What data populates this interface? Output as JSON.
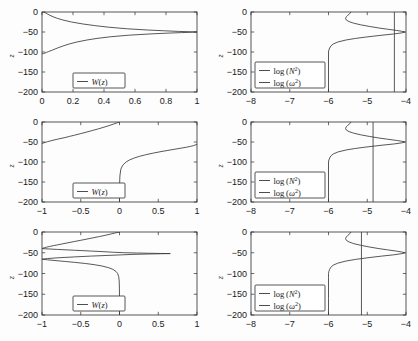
{
  "figure": {
    "rows": 3,
    "cols": 2,
    "background": "#fdfdfd",
    "curve_color": "#3a3a3a",
    "axis_color": "#2b2b2b"
  },
  "chart_data": [
    {
      "id": "panel-r1c1",
      "type": "line",
      "title": "",
      "xlabel": "",
      "ylabel": "z",
      "xlim": [
        0,
        1
      ],
      "ylim": [
        -200,
        0
      ],
      "xticks": [
        0,
        0.2,
        0.4,
        0.6,
        0.8,
        1
      ],
      "xticklabels": [
        "0",
        "0.2",
        "0.4",
        "0.6",
        "0.8",
        "1"
      ],
      "yticks": [
        0,
        -50,
        -100,
        -150,
        -200
      ],
      "yticklabels": [
        "0",
        "-50",
        "-100",
        "-150",
        "-200"
      ],
      "grid": false,
      "legend_position": "lower-center-left",
      "legend": [
        "W(z)"
      ],
      "series": [
        {
          "name": "W(z)",
          "orientation": "x-of-y",
          "y": [
            0,
            -2,
            -5,
            -8,
            -12,
            -16,
            -20,
            -25,
            -30,
            -34,
            -38,
            -42,
            -45,
            -47,
            -48.5,
            -49.5,
            -50,
            -50.5,
            -51.5,
            -53,
            -55,
            -58,
            -62,
            -66,
            -70,
            -75,
            -80,
            -85,
            -90,
            -95,
            -99,
            -101,
            -103,
            -104,
            -105
          ],
          "x": [
            0.012,
            0.022,
            0.035,
            0.05,
            0.072,
            0.1,
            0.135,
            0.19,
            0.265,
            0.34,
            0.43,
            0.55,
            0.68,
            0.79,
            0.88,
            0.96,
            1.0,
            0.97,
            0.9,
            0.8,
            0.69,
            0.56,
            0.44,
            0.355,
            0.29,
            0.225,
            0.175,
            0.135,
            0.1,
            0.068,
            0.042,
            0.029,
            0.018,
            0.009,
            0.0
          ]
        }
      ]
    },
    {
      "id": "panel-r1c2",
      "type": "line",
      "title": "",
      "xlabel": "",
      "ylabel": "z",
      "xlim": [
        -8,
        -4
      ],
      "ylim": [
        -200,
        0
      ],
      "xticks": [
        -8,
        -7,
        -6,
        -5,
        -4
      ],
      "xticklabels": [
        "-8",
        "-7",
        "-6",
        "-5",
        "-4"
      ],
      "yticks": [
        0,
        -50,
        -100,
        -150,
        -200
      ],
      "yticklabels": [
        "0",
        "-50",
        "-100",
        "-150",
        "-200"
      ],
      "grid": false,
      "legend_position": "lower-left",
      "legend": [
        "log (N^2)",
        "log (ω^2)"
      ],
      "series": [
        {
          "name": "log (N^2)",
          "orientation": "x-of-y",
          "y": [
            0,
            -4,
            -8,
            -12,
            -16,
            -20,
            -24,
            -28,
            -32,
            -36,
            -40,
            -43,
            -46,
            -48,
            -50,
            -52,
            -55,
            -58,
            -62,
            -66,
            -70,
            -75,
            -80,
            -85,
            -90,
            -95,
            -100,
            -110,
            -130,
            -160,
            -200
          ],
          "x": [
            -5.42,
            -5.45,
            -5.5,
            -5.54,
            -5.56,
            -5.54,
            -5.47,
            -5.35,
            -5.17,
            -4.95,
            -4.7,
            -4.48,
            -4.25,
            -4.12,
            -4.03,
            -4.1,
            -4.32,
            -4.62,
            -4.98,
            -5.3,
            -5.55,
            -5.76,
            -5.88,
            -5.94,
            -5.97,
            -5.99,
            -6.0,
            -6.0,
            -6.0,
            -6.0,
            -6.0
          ]
        },
        {
          "name": "log (ω^2)",
          "orientation": "vertical-line",
          "value": -4.3
        }
      ]
    },
    {
      "id": "panel-r2c1",
      "type": "line",
      "title": "",
      "xlabel": "",
      "ylabel": "z",
      "xlim": [
        -1,
        1
      ],
      "ylim": [
        -200,
        0
      ],
      "xticks": [
        -1,
        -0.5,
        0,
        0.5,
        1
      ],
      "xticklabels": [
        "-1",
        "-0.5",
        "0",
        "0.5",
        "1"
      ],
      "yticks": [
        0,
        -50,
        -100,
        -150,
        -200
      ],
      "yticklabels": [
        "0",
        "-50",
        "-100",
        "-150",
        "-200"
      ],
      "grid": false,
      "legend_position": "lower-center-left",
      "legend": [
        "W(z)"
      ],
      "series": [
        {
          "name": "W(z) upper branch",
          "orientation": "x-of-y",
          "y": [
            0,
            -2,
            -5,
            -9,
            -13,
            -17,
            -21,
            -25,
            -29,
            -33,
            -36,
            -39,
            -41,
            -43,
            -45,
            -47,
            -49,
            -51,
            -53,
            -54.5
          ],
          "x": [
            0.0,
            -0.03,
            -0.075,
            -0.135,
            -0.2,
            -0.27,
            -0.345,
            -0.42,
            -0.5,
            -0.58,
            -0.645,
            -0.705,
            -0.755,
            -0.8,
            -0.845,
            -0.885,
            -0.925,
            -0.96,
            -0.99,
            -1.0
          ]
        },
        {
          "name": "W(z) lower branch",
          "orientation": "x-of-y",
          "y": [
            -55.5,
            -57,
            -59,
            -61,
            -63,
            -65,
            -68,
            -71,
            -74,
            -78,
            -82,
            -86,
            -90,
            -95,
            -100,
            -108,
            -118,
            -135,
            -160,
            -200
          ],
          "x": [
            1.0,
            0.985,
            0.955,
            0.915,
            0.865,
            0.805,
            0.715,
            0.625,
            0.535,
            0.43,
            0.335,
            0.255,
            0.19,
            0.128,
            0.085,
            0.042,
            0.017,
            0.005,
            0.001,
            0.0
          ]
        }
      ]
    },
    {
      "id": "panel-r2c2",
      "type": "line",
      "title": "",
      "xlabel": "",
      "ylabel": "z",
      "xlim": [
        -8,
        -4
      ],
      "ylim": [
        -200,
        0
      ],
      "xticks": [
        -8,
        -7,
        -6,
        -5,
        -4
      ],
      "xticklabels": [
        "-8",
        "-7",
        "-6",
        "-5",
        "-4"
      ],
      "yticks": [
        0,
        -50,
        -100,
        -150,
        -200
      ],
      "yticklabels": [
        "0",
        "-50",
        "-100",
        "-150",
        "-200"
      ],
      "grid": false,
      "legend_position": "lower-left",
      "legend": [
        "log (N^2)",
        "log (ω^2)"
      ],
      "series": [
        {
          "name": "log (N^2)",
          "orientation": "x-of-y",
          "y": [
            0,
            -4,
            -8,
            -12,
            -16,
            -20,
            -24,
            -28,
            -32,
            -36,
            -40,
            -43,
            -46,
            -48,
            -50,
            -52,
            -55,
            -58,
            -62,
            -66,
            -70,
            -75,
            -80,
            -85,
            -90,
            -95,
            -100,
            -110,
            -130,
            -160,
            -200
          ],
          "x": [
            -5.42,
            -5.45,
            -5.5,
            -5.54,
            -5.56,
            -5.54,
            -5.47,
            -5.35,
            -5.17,
            -4.95,
            -4.7,
            -4.48,
            -4.25,
            -4.12,
            -4.03,
            -4.1,
            -4.32,
            -4.62,
            -4.98,
            -5.3,
            -5.55,
            -5.76,
            -5.88,
            -5.94,
            -5.97,
            -5.99,
            -6.0,
            -6.0,
            -6.0,
            -6.0,
            -6.0
          ]
        },
        {
          "name": "log (ω^2)",
          "orientation": "vertical-line",
          "value": -4.85
        }
      ]
    },
    {
      "id": "panel-r3c1",
      "type": "line",
      "title": "",
      "xlabel": "",
      "ylabel": "z",
      "xlim": [
        -1,
        1
      ],
      "ylim": [
        -200,
        0
      ],
      "xticks": [
        -1,
        -0.5,
        0,
        0.5,
        1
      ],
      "xticklabels": [
        "-1",
        "-0.5",
        "0",
        "0.5",
        "1"
      ],
      "yticks": [
        0,
        -50,
        -100,
        -150,
        -200
      ],
      "yticklabels": [
        "0",
        "-50",
        "-100",
        "-150",
        "-200"
      ],
      "grid": false,
      "legend_position": "lower-center-left",
      "legend": [
        "W(z)"
      ],
      "series": [
        {
          "name": "W(z) upper branch",
          "orientation": "x-of-y",
          "y": [
            0,
            -2,
            -5,
            -8,
            -11,
            -14,
            -17,
            -20,
            -23,
            -26,
            -29,
            -31,
            -33,
            -35,
            -36.5,
            -38,
            -39,
            -40
          ],
          "x": [
            0.0,
            -0.05,
            -0.115,
            -0.185,
            -0.26,
            -0.34,
            -0.42,
            -0.5,
            -0.585,
            -0.665,
            -0.745,
            -0.8,
            -0.855,
            -0.905,
            -0.94,
            -0.97,
            -0.99,
            -1.0
          ]
        },
        {
          "name": "W(z) resonance upper",
          "orientation": "x-of-y",
          "y": [
            -40,
            -42,
            -44,
            -46,
            -47.5,
            -48.8,
            -49.8,
            -50.6,
            -51.2,
            -51.7,
            -52
          ],
          "x": [
            -1.0,
            -0.8,
            -0.58,
            -0.36,
            -0.2,
            -0.08,
            0.05,
            0.22,
            0.38,
            0.53,
            0.65
          ]
        },
        {
          "name": "W(z) resonance lower",
          "orientation": "x-of-y",
          "y": [
            -52,
            -52.4,
            -53,
            -53.8,
            -55,
            -56.5,
            -58,
            -60,
            -62,
            -64,
            -65.5
          ],
          "x": [
            0.65,
            0.53,
            0.37,
            0.2,
            0.03,
            -0.16,
            -0.36,
            -0.58,
            -0.78,
            -0.93,
            -1.0
          ]
        },
        {
          "name": "W(z) lower branch",
          "orientation": "x-of-y",
          "y": [
            -65.5,
            -67,
            -69,
            -71,
            -73,
            -76,
            -79,
            -82,
            -86,
            -90,
            -95,
            -100,
            -108,
            -118,
            -135,
            -160,
            -200
          ],
          "x": [
            -1.0,
            -0.93,
            -0.82,
            -0.7,
            -0.585,
            -0.435,
            -0.315,
            -0.225,
            -0.14,
            -0.085,
            -0.045,
            -0.024,
            -0.01,
            -0.004,
            -0.001,
            0.0,
            0.0
          ]
        }
      ]
    },
    {
      "id": "panel-r3c2",
      "type": "line",
      "title": "",
      "xlabel": "",
      "ylabel": "z",
      "xlim": [
        -8,
        -4
      ],
      "ylim": [
        -200,
        0
      ],
      "xticks": [
        -8,
        -7,
        -6,
        -5,
        -4
      ],
      "xticklabels": [
        "-8",
        "-7",
        "-6",
        "-5",
        "-4"
      ],
      "yticks": [
        0,
        -50,
        -100,
        -150,
        -200
      ],
      "yticklabels": [
        "0",
        "-50",
        "-100",
        "-150",
        "-200"
      ],
      "grid": false,
      "legend_position": "lower-left",
      "legend": [
        "log (N^2)",
        "log (ω^2)"
      ],
      "series": [
        {
          "name": "log (N^2)",
          "orientation": "x-of-y",
          "y": [
            0,
            -4,
            -8,
            -12,
            -16,
            -20,
            -24,
            -28,
            -32,
            -36,
            -40,
            -43,
            -46,
            -48,
            -50,
            -52,
            -55,
            -58,
            -62,
            -66,
            -70,
            -75,
            -80,
            -85,
            -90,
            -95,
            -100,
            -110,
            -130,
            -160,
            -200
          ],
          "x": [
            -5.42,
            -5.45,
            -5.5,
            -5.54,
            -5.56,
            -5.54,
            -5.47,
            -5.35,
            -5.17,
            -4.95,
            -4.7,
            -4.48,
            -4.25,
            -4.12,
            -4.03,
            -4.1,
            -4.32,
            -4.62,
            -4.98,
            -5.3,
            -5.55,
            -5.76,
            -5.88,
            -5.94,
            -5.97,
            -5.99,
            -6.0,
            -6.0,
            -6.0,
            -6.0,
            -6.0
          ]
        },
        {
          "name": "log (ω^2)",
          "orientation": "vertical-line",
          "value": -5.15
        }
      ]
    }
  ],
  "legend_labels": {
    "w_of_z": "W(z)",
    "log_N2_pre": "log (",
    "log_N2_sym": "N",
    "log_N2_sup": "2",
    "log_N2_post": ")",
    "log_w2_pre": "log (",
    "log_w2_sym": "ω",
    "log_w2_sup": "2",
    "log_w2_post": ")"
  },
  "axis_label_z": "z"
}
